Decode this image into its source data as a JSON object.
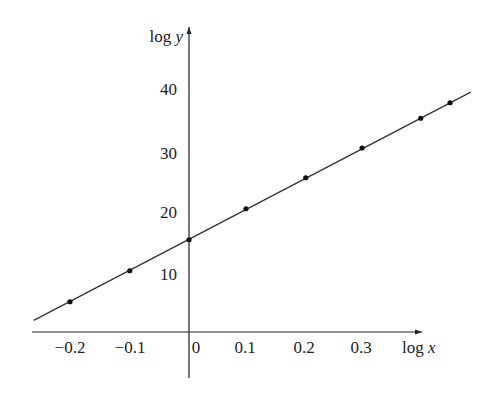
{
  "chart_data": {
    "type": "scatter",
    "title": "",
    "xlabel": "log x",
    "ylabel": "log y",
    "x_ticks": [
      "-0.2",
      "-0.1",
      "0",
      "0.1",
      "0.2",
      "0.3"
    ],
    "y_ticks": [
      "10",
      "20",
      "30",
      "40"
    ],
    "xlim": [
      -0.27,
      0.41
    ],
    "ylim": [
      0,
      45
    ],
    "grid": false,
    "legend": null,
    "series": [
      {
        "name": "data points",
        "x": [
          -0.207,
          -0.103,
          0.0,
          0.099,
          0.203,
          0.301,
          0.403,
          0.454
        ],
        "y": [
          5.2,
          10.2,
          15.2,
          20.2,
          25.2,
          30.0,
          34.8,
          37.3
        ]
      },
      {
        "name": "best-fit line",
        "type": "line",
        "x": [
          -0.27,
          0.49
        ],
        "y": [
          2.2,
          39.0
        ]
      }
    ]
  },
  "labels": {
    "x_axis": "log x",
    "y_axis": "log y",
    "x_ticks": [
      {
        "text": "−0.2",
        "px": 70
      },
      {
        "text": "−0.1",
        "px": 130
      },
      {
        "text": "0",
        "px": 196
      },
      {
        "text": "0.1",
        "px": 245
      },
      {
        "text": "0.2",
        "px": 304
      },
      {
        "text": "0.3",
        "px": 361
      }
    ],
    "y_ticks": [
      {
        "text": "40",
        "py": 95
      },
      {
        "text": "30",
        "py": 159
      },
      {
        "text": "20",
        "py": 218
      },
      {
        "text": "10",
        "py": 280
      }
    ]
  }
}
